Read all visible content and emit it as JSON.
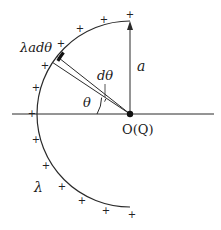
{
  "diagram": {
    "type": "semicircular line charge about point O",
    "labels": {
      "element_charge": "λadθ",
      "angle_element": "dθ",
      "angle": "θ",
      "radius": "a",
      "origin": "O(Q)",
      "line_density": "λ"
    },
    "charge_sign": "+",
    "geometry": {
      "center": [
        130,
        114
      ],
      "radius_px": 93,
      "arc_from_deg": 90,
      "arc_to_deg": 270,
      "element_angle_deg": 150,
      "element_width_deg": 6
    },
    "colors": {
      "stroke": "#2a2a2a",
      "background": "#ffffff"
    }
  }
}
